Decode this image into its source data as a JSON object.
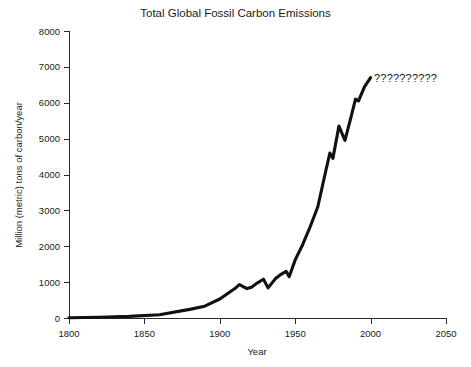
{
  "chart_data": {
    "type": "line",
    "title": "Total Global Fossil Carbon Emissions",
    "xlabel": "Year",
    "ylabel": "Million (metric) tons of carbon/year",
    "xlim": [
      1800,
      2050
    ],
    "ylim": [
      0,
      8000
    ],
    "xticks": [
      1800,
      1850,
      1900,
      1950,
      2000,
      2050
    ],
    "yticks": [
      0,
      1000,
      2000,
      3000,
      4000,
      5000,
      6000,
      7000,
      8000
    ],
    "xtick_labels": [
      "1800",
      "1850",
      "1900",
      "1950",
      "2000",
      "2050"
    ],
    "ytick_labels": [
      "0",
      "1000",
      "2000",
      "3000",
      "4000",
      "5000",
      "6000",
      "7000",
      "8000"
    ],
    "grid": false,
    "legend": false,
    "line_color": "#111111",
    "series": [
      {
        "name": "Total Global Fossil Carbon Emissions",
        "x": [
          1800,
          1820,
          1840,
          1860,
          1880,
          1890,
          1900,
          1910,
          1913,
          1918,
          1921,
          1925,
          1929,
          1932,
          1937,
          1940,
          1944,
          1946,
          1950,
          1955,
          1960,
          1965,
          1970,
          1973,
          1975,
          1979,
          1983,
          1987,
          1990,
          1992,
          1996,
          2000
        ],
        "y": [
          8,
          20,
          45,
          90,
          240,
          330,
          530,
          820,
          930,
          820,
          860,
          980,
          1080,
          840,
          1100,
          1200,
          1300,
          1150,
          1620,
          2050,
          2550,
          3100,
          4050,
          4600,
          4450,
          5350,
          4950,
          5600,
          6100,
          6050,
          6450,
          6700
        ]
      }
    ],
    "annotations": [
      {
        "text": "??????????",
        "x": 2005,
        "y": 6950,
        "meaning": "future-emissions-unknown"
      }
    ]
  },
  "axis_geometry": {
    "plot_left": 69,
    "plot_right": 446,
    "plot_bottom": 318,
    "plot_top": 31
  }
}
